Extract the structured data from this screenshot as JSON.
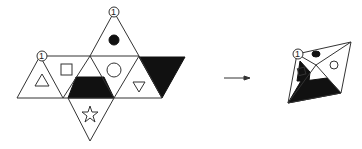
{
  "diagram": {
    "net": {
      "labels": [
        {
          "text": "1",
          "position": "top apex"
        },
        {
          "text": "1",
          "position": "left apex"
        }
      ],
      "faces": [
        "triangle",
        "square",
        "black-trapezoid",
        "black-dot",
        "circle",
        "inverted-triangle",
        "black-triangle",
        "star"
      ]
    },
    "arrow": {
      "direction": "right"
    },
    "solid": {
      "labels": [
        {
          "text": "1"
        }
      ],
      "faces": [
        "black-dot",
        "square",
        "circle",
        "black-trapezoid"
      ]
    }
  }
}
